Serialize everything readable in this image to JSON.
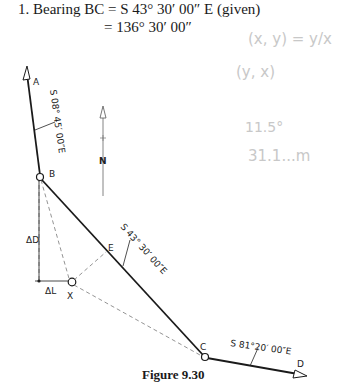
{
  "text": {
    "line1": "1.  Bearing BC = S 43° 30′ 00″ E (given)",
    "line2": "= 136° 30′ 00″",
    "caption": "Figure 9.30"
  },
  "diagram": {
    "points": {
      "A": "A",
      "B": "B",
      "C": "C",
      "D": "D",
      "E": "E",
      "X": "X"
    },
    "north": "N",
    "bearings": {
      "AB": "S 08° 45′ 00″E",
      "BC": "S 43° 30′ 00″E",
      "CD": "S 81°20′ 00″E"
    },
    "delta_d": "ΔD",
    "delta_l": "ΔL"
  },
  "handwriting": {
    "line1": "(x, y) = y/x",
    "line2": "(y, x)",
    "line3": "11.5°",
    "line4": "31.1...m"
  }
}
